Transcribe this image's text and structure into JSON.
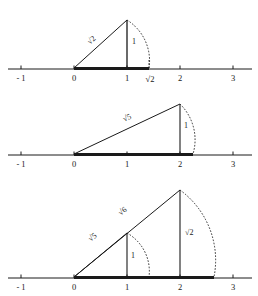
{
  "figure": {
    "geometry": {
      "origin_x": 74,
      "unit_px": 53,
      "stroke_color": "#1a1a1a"
    },
    "panels": [
      {
        "name": "panel-sqrt2",
        "axis_y": 69,
        "axis_x_start": 8,
        "axis_x_end": 252,
        "ticks": [
          {
            "label": "- 1",
            "value": -1
          },
          {
            "label": "0",
            "value": 0
          },
          {
            "label": "1",
            "value": 1
          },
          {
            "label": "√2",
            "value": 1.414
          },
          {
            "label": "2",
            "value": 2
          },
          {
            "label": "3",
            "value": 3
          }
        ],
        "bold_segment": {
          "from": 0,
          "to": 1.414
        },
        "triangles": [
          {
            "name": "triangle-sqrt2",
            "base_from": 0,
            "base_to": 1,
            "apex_value": 1,
            "apex_height_px": 48,
            "hypotenuse_label": "√2",
            "vertical_label": "1",
            "arc_to": 1.414
          }
        ]
      },
      {
        "name": "panel-sqrt5",
        "axis_y": 155,
        "axis_x_start": 8,
        "axis_x_end": 252,
        "ticks": [
          {
            "label": "- 1",
            "value": -1
          },
          {
            "label": "0",
            "value": 0
          },
          {
            "label": "1",
            "value": 1
          },
          {
            "label": "2",
            "value": 2
          },
          {
            "label": "3",
            "value": 3
          }
        ],
        "bold_segment": {
          "from": 0,
          "to": 2.236
        },
        "triangles": [
          {
            "name": "triangle-sqrt5",
            "base_from": 0,
            "base_to": 2,
            "apex_value": 2,
            "apex_height_px": 50,
            "hypotenuse_label": "√5",
            "vertical_label": "1",
            "arc_to": 2.236
          }
        ]
      },
      {
        "name": "panel-sqrt6-sqrt7",
        "axis_y": 278,
        "axis_x_start": 8,
        "axis_x_end": 252,
        "ticks": [
          {
            "label": "- 1",
            "value": -1
          },
          {
            "label": "0",
            "value": 0
          },
          {
            "label": "1",
            "value": 1
          },
          {
            "label": "2",
            "value": 2
          },
          {
            "label": "3",
            "value": 3
          }
        ],
        "bold_segment": {
          "from": 0,
          "to": 2.646
        },
        "triangles": [
          {
            "name": "triangle-sqrt5-inner",
            "base_from": 0,
            "base_to": 1,
            "apex_value": 1,
            "apex_height_px": 44,
            "hypotenuse_label": "√5",
            "vertical_label": "1",
            "arc_to": 1.414
          },
          {
            "name": "triangle-sqrt6-outer",
            "base_from": 0,
            "base_to": 2,
            "apex_value": 2,
            "apex_height_px": 87,
            "hypotenuse_label": "√6",
            "vertical_label": "√2",
            "arc_to": 2.646
          }
        ]
      }
    ],
    "labels": {
      "panel1_hyp": "√2",
      "panel1_vert": "1",
      "panel1_tick_irrational": "√2",
      "panel2_hyp": "√5",
      "panel2_vert": "1",
      "panel3_hyp_inner": "√5",
      "panel3_hyp_outer": "√6",
      "panel3_vert_inner": "1",
      "panel3_vert_outer": "√2",
      "tick_minus1": "- 1",
      "tick_0": "0",
      "tick_1": "1",
      "tick_2": "2",
      "tick_3": "3"
    }
  }
}
